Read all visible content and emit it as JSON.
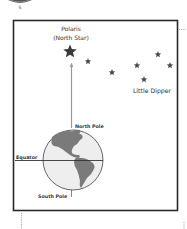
{
  "compass": {
    "direction_label": "S"
  },
  "polaris": {
    "name": "Polaris",
    "alt_name": "(North Star)"
  },
  "constellation": {
    "label": "Little Dipper"
  },
  "earth": {
    "north_label": "North Pole",
    "south_label": "South Pole",
    "equator_label": "Equator"
  },
  "colors": {
    "frame": "#2a2a2a",
    "star": "#444444",
    "globe_ocean": "#eeeeee",
    "globe_land": "#7a7a7a",
    "axis": "#888888"
  }
}
